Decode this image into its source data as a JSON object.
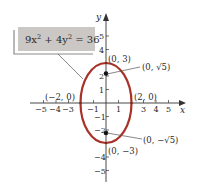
{
  "equation": {
    "label": "9x² + 4y² = 36",
    "parts": [
      "9x",
      "2",
      " + 4y",
      "2",
      " = 36"
    ],
    "box_fill": "#cbc7c4",
    "shadow_color": "#8a8a8a"
  },
  "axes": {
    "x_name": "x",
    "y_name": "y",
    "x_ticks": [
      "−5",
      "−4",
      "−3",
      "−1",
      "1",
      "3",
      "4",
      "5"
    ],
    "y_ticks": [
      "5",
      "4",
      "2",
      "1",
      "−1",
      "−2",
      "−4",
      "−5"
    ],
    "color": "#333333"
  },
  "ellipse": {
    "color": "#a83227",
    "center": [
      0,
      0
    ],
    "semi_major_y": 3,
    "semi_minor_x": 2
  },
  "points": {
    "top_vertex": "(0, 3)",
    "bottom_vertex": "(0, −3)",
    "right_covertex": "(2, 0)",
    "left_covertex": "(−2, 0)",
    "focus_top": "(0, √5)",
    "focus_bottom": "(0, −√5)"
  }
}
